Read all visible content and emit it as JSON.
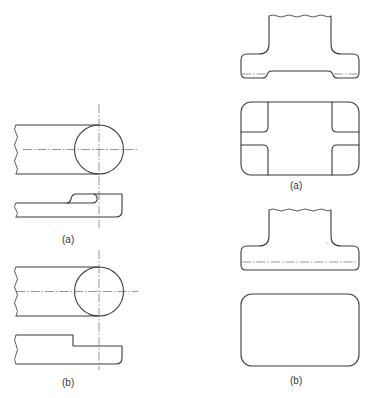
{
  "figure": {
    "left_column": {
      "views": [
        {
          "id": "a",
          "label": "(a)",
          "features": [
            "plan view with round boss",
            "elevation with raised rounded boss"
          ]
        },
        {
          "id": "b",
          "label": "(b)",
          "features": [
            "plan view with round boss",
            "elevation with stepped end"
          ]
        }
      ]
    },
    "right_column": {
      "views": [
        {
          "id": "a",
          "label": "(a)",
          "features": [
            "elevation with recessed underside",
            "plan with four rounded corner pads"
          ]
        },
        {
          "id": "b",
          "label": "(b)",
          "features": [
            "elevation with flat underside",
            "plan as plain rounded rectangle"
          ]
        }
      ]
    }
  },
  "colors": {
    "line": "#3a3a3a",
    "centerline": "#6a6a6a",
    "background": "#ffffff"
  }
}
